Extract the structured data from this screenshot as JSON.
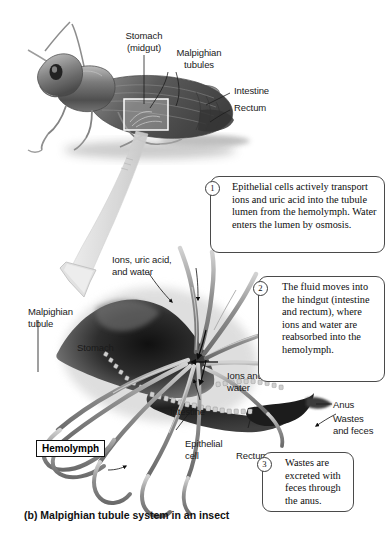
{
  "figure": {
    "caption": "(b) Malpighian tubule system in an insect"
  },
  "insect_labels": [
    {
      "name": "stomach-midgut",
      "text": "Stomach\n(midgut)"
    },
    {
      "name": "malpighian-tubules",
      "text": "Malpighian\ntubules"
    },
    {
      "name": "intestine",
      "text": "Intestine"
    },
    {
      "name": "rectum",
      "text": "Rectum"
    }
  ],
  "detail_labels": [
    {
      "name": "ions-uric-acid-water",
      "text": "Ions, uric acid,\nand water"
    },
    {
      "name": "malpighian-tubule",
      "text": "Malpighian\ntubule"
    },
    {
      "name": "stomach",
      "text": "Stomach"
    },
    {
      "name": "ions-and-water",
      "text": "Ions and\nwater"
    },
    {
      "name": "intestine",
      "text": "Intestine"
    },
    {
      "name": "epithelial-cell",
      "text": "Epithelial\ncell"
    },
    {
      "name": "rectum",
      "text": "Rectum"
    },
    {
      "name": "anus",
      "text": "Anus"
    },
    {
      "name": "wastes-and-feces",
      "text": "Wastes\nand feces"
    }
  ],
  "hemolymph_label": "Hemolymph",
  "callouts": [
    {
      "number": "1",
      "text": "Epithelial cells actively transport ions and uric acid into the tubule lumen from the hemolymph. Water enters the lumen by osmosis."
    },
    {
      "number": "2",
      "text": "The fluid moves into the hindgut (intestine and rectum), where ions and water are reabsorbed into the hemolymph."
    },
    {
      "number": "3",
      "text": "Wastes are excreted with feces through the anus."
    }
  ],
  "colors": {
    "background": "#ffffff",
    "text": "#111111",
    "callout_border": "#4a4a4a",
    "stomach_dark": "#2b2b2b",
    "tubule_gray": "#9a9a9a",
    "insect_gray": "#6d6d6d"
  }
}
